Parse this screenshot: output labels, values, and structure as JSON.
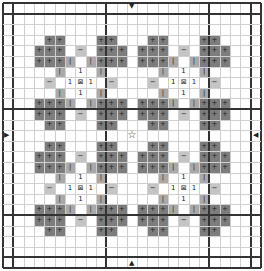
{
  "canvas": {
    "cols": 25,
    "rows": 25,
    "cell_w": 10.32,
    "cell_h": 10.6,
    "thick_every": 10,
    "inner_border": [
      1,
      24
    ]
  },
  "colors": {
    "dark": "#7d7d7d",
    "mid": "#a9a9a9",
    "light": "#c4c4c4",
    "grid": "#cfcfcf",
    "thick": "#333333"
  },
  "symbols": {
    "dark": "+",
    "mid": "|",
    "light": "−",
    "number": "1",
    "center": "⊠",
    "star": "☆"
  },
  "arrows": {
    "top": "▼",
    "bottom": "▲",
    "left": "▶",
    "right": "◀"
  },
  "motif": {
    "center": [
      7,
      7
    ],
    "cells": [
      {
        "dr": -4,
        "dc": -3,
        "t": "dark"
      },
      {
        "dr": -4,
        "dc": -2,
        "t": "dark"
      },
      {
        "dr": -4,
        "dc": 2,
        "t": "dark"
      },
      {
        "dr": -4,
        "dc": 3,
        "t": "dark"
      },
      {
        "dr": -3,
        "dc": -4,
        "t": "dark"
      },
      {
        "dr": -3,
        "dc": -3,
        "t": "dark"
      },
      {
        "dr": -3,
        "dc": -2,
        "t": "dark"
      },
      {
        "dr": -3,
        "dc": 0,
        "t": "light"
      },
      {
        "dr": -3,
        "dc": 2,
        "t": "dark"
      },
      {
        "dr": -3,
        "dc": 3,
        "t": "dark"
      },
      {
        "dr": -3,
        "dc": 4,
        "t": "dark"
      },
      {
        "dr": -2,
        "dc": -4,
        "t": "dark"
      },
      {
        "dr": -2,
        "dc": -3,
        "t": "dark"
      },
      {
        "dr": -2,
        "dc": -2,
        "t": "dark"
      },
      {
        "dr": -2,
        "dc": -1,
        "t": "mid"
      },
      {
        "dr": -2,
        "dc": 1,
        "t": "mid"
      },
      {
        "dr": -2,
        "dc": 2,
        "t": "dark"
      },
      {
        "dr": -2,
        "dc": 3,
        "t": "dark"
      },
      {
        "dr": -2,
        "dc": 4,
        "t": "dark"
      },
      {
        "dr": -1,
        "dc": -2,
        "t": "mid"
      },
      {
        "dr": -1,
        "dc": 0,
        "t": "number"
      },
      {
        "dr": -1,
        "dc": 2,
        "t": "mid"
      },
      {
        "dr": 0,
        "dc": -3,
        "t": "light"
      },
      {
        "dr": 0,
        "dc": -1,
        "t": "number"
      },
      {
        "dr": 0,
        "dc": 0,
        "t": "center"
      },
      {
        "dr": 0,
        "dc": 1,
        "t": "number"
      },
      {
        "dr": 0,
        "dc": 3,
        "t": "light"
      },
      {
        "dr": 1,
        "dc": -2,
        "t": "mid"
      },
      {
        "dr": 1,
        "dc": 0,
        "t": "number"
      },
      {
        "dr": 1,
        "dc": 2,
        "t": "mid"
      },
      {
        "dr": 2,
        "dc": -4,
        "t": "dark"
      },
      {
        "dr": 2,
        "dc": -3,
        "t": "dark"
      },
      {
        "dr": 2,
        "dc": -2,
        "t": "dark"
      },
      {
        "dr": 2,
        "dc": -1,
        "t": "mid"
      },
      {
        "dr": 2,
        "dc": 1,
        "t": "mid"
      },
      {
        "dr": 2,
        "dc": 2,
        "t": "dark"
      },
      {
        "dr": 2,
        "dc": 3,
        "t": "dark"
      },
      {
        "dr": 2,
        "dc": 4,
        "t": "dark"
      },
      {
        "dr": 3,
        "dc": -4,
        "t": "dark"
      },
      {
        "dr": 3,
        "dc": -3,
        "t": "dark"
      },
      {
        "dr": 3,
        "dc": -2,
        "t": "dark"
      },
      {
        "dr": 3,
        "dc": 0,
        "t": "light"
      },
      {
        "dr": 3,
        "dc": 2,
        "t": "dark"
      },
      {
        "dr": 3,
        "dc": 3,
        "t": "dark"
      },
      {
        "dr": 3,
        "dc": 4,
        "t": "dark"
      },
      {
        "dr": 4,
        "dc": -3,
        "t": "dark"
      },
      {
        "dr": 4,
        "dc": -2,
        "t": "dark"
      },
      {
        "dr": 4,
        "dc": 2,
        "t": "dark"
      },
      {
        "dr": 4,
        "dc": 3,
        "t": "dark"
      }
    ]
  },
  "motif_centers": [
    [
      7,
      7
    ],
    [
      7,
      17
    ],
    [
      17,
      7
    ],
    [
      17,
      17
    ]
  ],
  "star_cell": [
    12,
    12
  ]
}
